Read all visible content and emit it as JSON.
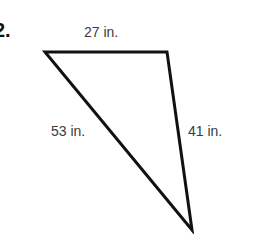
{
  "problem": {
    "number": "2."
  },
  "triangle": {
    "stroke_color": "#111111",
    "vertices": {
      "top_left": [
        45,
        52
      ],
      "top_right": [
        167,
        52
      ],
      "bottom": [
        192,
        230
      ]
    },
    "sides": {
      "top": {
        "label": "27 in.",
        "length": 27,
        "unit": "in."
      },
      "left": {
        "label": "53 in.",
        "length": 53,
        "unit": "in."
      },
      "right": {
        "label": "41 in.",
        "length": 41,
        "unit": "in."
      }
    }
  }
}
